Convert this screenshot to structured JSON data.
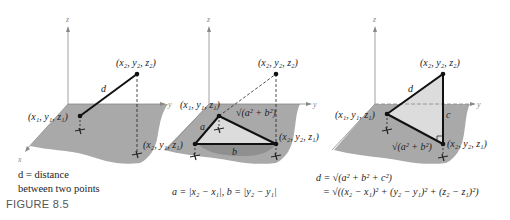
{
  "figure_label": "FIGURE 8.5",
  "panels": [
    {
      "axes": {
        "z": "z",
        "y": "y",
        "x": "x"
      },
      "points": {
        "p1": "(x₁, y₁, z₁)",
        "p2": "(x₂, y₂, z₂)"
      },
      "segment_label": "d",
      "caption_line1": "d = distance",
      "caption_line2": "between two points"
    },
    {
      "axes": {
        "z": "z",
        "y": "y",
        "x": "x"
      },
      "points": {
        "p1": "(x₁, y₁, z₁)",
        "p2": "(x₂, y₂, z₂)",
        "p3": "(x₂, y₁, z₁)",
        "p4": "(x₂, y₂, z₁)"
      },
      "side_a": "a",
      "side_b": "b",
      "hyp_label": "√(a² + b²)",
      "caption": "a = |x₂ − x₁|, b = |y₂ − y₁|"
    },
    {
      "axes": {
        "z": "z",
        "y": "y",
        "x": "x"
      },
      "points": {
        "p1": "(x₁, y₁, z₁)",
        "p2": "(x₂, y₂, z₂)",
        "p4": "(x₂, y₂, z₁)"
      },
      "side_d": "d",
      "side_c": "c",
      "base_label": "√(a² + b²)",
      "eq_line1": "d = √(a² + b² + c²)",
      "eq_line2": "= √((x₂ − x₁)² + (y₂ − y₁)² + (z₂ − z₁)²)"
    }
  ]
}
